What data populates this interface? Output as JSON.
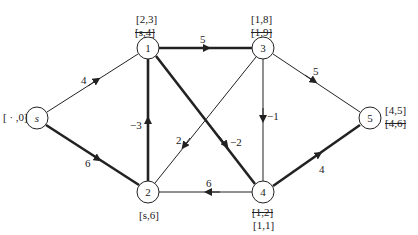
{
  "diagram": {
    "type": "directed-weighted-graph",
    "colors": {
      "line": "#222222",
      "background": "#ffffff"
    },
    "nodes": [
      {
        "id": "s",
        "label": "s",
        "x": 37,
        "y": 118,
        "labels": [
          {
            "text": "[ · ,0]",
            "struck": false
          }
        ]
      },
      {
        "id": "1",
        "label": "1",
        "x": 148,
        "y": 48,
        "labels": [
          {
            "text": "[2,3]",
            "struck": false
          },
          {
            "text": "[s,4]",
            "struck": true
          }
        ]
      },
      {
        "id": "2",
        "label": "2",
        "x": 148,
        "y": 192,
        "labels": [
          {
            "text": "[s,6]",
            "struck": false
          }
        ]
      },
      {
        "id": "3",
        "label": "3",
        "x": 263,
        "y": 48,
        "labels": [
          {
            "text": "[1,8]",
            "struck": false
          },
          {
            "text": "[1,9]",
            "struck": true
          }
        ]
      },
      {
        "id": "4",
        "label": "4",
        "x": 263,
        "y": 192,
        "labels": [
          {
            "text": "[1,2]",
            "struck": true
          },
          {
            "text": "[1,1]",
            "struck": false
          }
        ]
      },
      {
        "id": "5",
        "label": "5",
        "x": 370,
        "y": 118,
        "labels": [
          {
            "text": "[4,5]",
            "struck": false
          },
          {
            "text": "[4,6]",
            "struck": true
          }
        ]
      }
    ],
    "edges": [
      {
        "from": "s",
        "to": "1",
        "weight": "4",
        "bold": false
      },
      {
        "from": "s",
        "to": "2",
        "weight": "6",
        "bold": true
      },
      {
        "from": "1",
        "to": "3",
        "weight": "5",
        "bold": true
      },
      {
        "from": "1",
        "to": "4",
        "weight": "−2",
        "bold": true
      },
      {
        "from": "2",
        "to": "1",
        "weight": "−3",
        "bold": true
      },
      {
        "from": "3",
        "to": "2",
        "weight": "2",
        "bold": false
      },
      {
        "from": "3",
        "to": "4",
        "weight": "−1",
        "bold": false
      },
      {
        "from": "3",
        "to": "5",
        "weight": "5",
        "bold": false
      },
      {
        "from": "4",
        "to": "2",
        "weight": "6",
        "bold": false
      },
      {
        "from": "4",
        "to": "5",
        "weight": "4",
        "bold": true
      }
    ]
  },
  "labels": {
    "s_label": "[ · ,0]",
    "n1_top": "[2,3]",
    "n1_struck": "[s,4]",
    "n2_label": "[s,6]",
    "n3_top": "[1,8]",
    "n3_struck": "[1,9]",
    "n4_struck": "[1,2]",
    "n4_label": "[1,1]",
    "n5_top": "[4,5]",
    "n5_struck": "[4,6]",
    "w_s1": "4",
    "w_s2": "6",
    "w_13": "5",
    "w_14": "−2",
    "w_21": "−3",
    "w_32": "2",
    "w_34": "−1",
    "w_35": "5",
    "w_42": "6",
    "w_45": "4",
    "node_s": "s",
    "node_1": "1",
    "node_2": "2",
    "node_3": "3",
    "node_4": "4",
    "node_5": "5"
  }
}
